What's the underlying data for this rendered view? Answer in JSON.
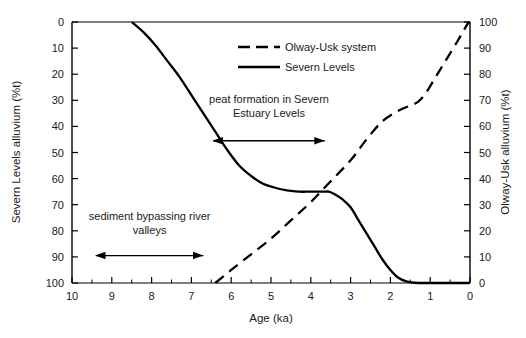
{
  "chart_data": {
    "type": "line",
    "title": "",
    "xlabel": "Age (ka)",
    "ylabel": "Severn Levels alluvium (%t)",
    "y2label": "Olway-Usk alluvium (%t)",
    "xlim": [
      10,
      0
    ],
    "x_reversed": true,
    "ylim": [
      100,
      0
    ],
    "y_inverted": true,
    "y2lim": [
      0,
      100
    ],
    "grid": false,
    "legend_position": "top-center",
    "xticks": [
      10,
      9,
      8,
      7,
      6,
      5,
      4,
      3,
      2,
      1,
      0
    ],
    "xtick_labels": [
      "10",
      "9",
      "8",
      "7",
      "6",
      "5",
      "4",
      "3",
      "2",
      "1",
      "0"
    ],
    "x_minor_tick_step": 0.5,
    "yticks": [
      0,
      10,
      20,
      30,
      40,
      50,
      60,
      70,
      80,
      90,
      100
    ],
    "ytick_labels": [
      "0",
      "10",
      "20",
      "30",
      "40",
      "50",
      "60",
      "70",
      "80",
      "90",
      "100"
    ],
    "y2ticks": [
      100,
      90,
      80,
      70,
      60,
      50,
      40,
      30,
      20,
      10,
      0
    ],
    "y2tick_labels": [
      "100",
      "90",
      "80",
      "70",
      "60",
      "50",
      "40",
      "30",
      "20",
      "10",
      "0"
    ],
    "series": [
      {
        "name": "Severn Levels",
        "axis": "left",
        "style": "solid",
        "color": "#000000",
        "points": [
          [
            8.5,
            0
          ],
          [
            8.2,
            4
          ],
          [
            7.9,
            9
          ],
          [
            7.6,
            15
          ],
          [
            7.3,
            21
          ],
          [
            7.0,
            28
          ],
          [
            6.7,
            35
          ],
          [
            6.4,
            42
          ],
          [
            6.1,
            49
          ],
          [
            5.8,
            55
          ],
          [
            5.5,
            59
          ],
          [
            5.2,
            62
          ],
          [
            4.9,
            63.5
          ],
          [
            4.6,
            64.5
          ],
          [
            4.3,
            65
          ],
          [
            4.0,
            65
          ],
          [
            3.7,
            65
          ],
          [
            3.55,
            65
          ],
          [
            3.4,
            66
          ],
          [
            3.2,
            68
          ],
          [
            3.0,
            71
          ],
          [
            2.8,
            76
          ],
          [
            2.6,
            81
          ],
          [
            2.4,
            86
          ],
          [
            2.2,
            91
          ],
          [
            2.0,
            95
          ],
          [
            1.8,
            98
          ],
          [
            1.6,
            99.4
          ],
          [
            1.4,
            99.9
          ],
          [
            1.0,
            100
          ],
          [
            0.5,
            100
          ],
          [
            0.0,
            100
          ]
        ]
      },
      {
        "name": "Olway-Usk system",
        "axis": "right",
        "style": "dashed",
        "color": "#000000",
        "points": [
          [
            6.4,
            0
          ],
          [
            6.0,
            5
          ],
          [
            5.5,
            11
          ],
          [
            5.0,
            17
          ],
          [
            4.5,
            24
          ],
          [
            4.0,
            31
          ],
          [
            3.5,
            39
          ],
          [
            3.0,
            47
          ],
          [
            2.6,
            55
          ],
          [
            2.2,
            62
          ],
          [
            1.8,
            66
          ],
          [
            1.5,
            68
          ],
          [
            1.3,
            69.5
          ],
          [
            1.1,
            73
          ],
          [
            0.9,
            78
          ],
          [
            0.7,
            83
          ],
          [
            0.5,
            88
          ],
          [
            0.3,
            93
          ],
          [
            0.15,
            97
          ],
          [
            0.05,
            99.5
          ],
          [
            0.0,
            100
          ]
        ]
      }
    ],
    "annotations": [
      {
        "id": "peat",
        "text_line1": "peat formation in Severn",
        "text_line2": "Estuary Levels",
        "arrow": "double",
        "x_start": 6.45,
        "x_end": 3.65,
        "y_left_axis": 45.5,
        "text_y_left_axis": 31
      },
      {
        "id": "sediment",
        "text_line1": "sediment bypassing river",
        "text_line2": "valleys",
        "arrow": "double",
        "x_start": 9.4,
        "x_end": 6.7,
        "y_left_axis": 89.5,
        "text_y_left_axis": 76
      }
    ],
    "legend": [
      {
        "label": "Olway-Usk system",
        "style": "dashed"
      },
      {
        "label": "Severn Levels",
        "style": "solid"
      }
    ]
  }
}
